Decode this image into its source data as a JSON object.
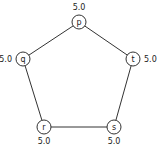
{
  "graph": {
    "nodes": [
      {
        "id": "p",
        "label": "p",
        "value": "5.0",
        "x": 79,
        "y": 22,
        "vx": 79,
        "vy": 10,
        "anchor": "middle"
      },
      {
        "id": "q",
        "label": "q",
        "value": "5.0",
        "x": 23,
        "y": 59,
        "vx": 12,
        "vy": 62,
        "anchor": "end"
      },
      {
        "id": "t",
        "label": "t",
        "value": "5.0",
        "x": 133,
        "y": 59,
        "vx": 144,
        "vy": 62,
        "anchor": "start"
      },
      {
        "id": "r",
        "label": "r",
        "value": "5.0",
        "x": 44,
        "y": 127,
        "vx": 44,
        "vy": 144,
        "anchor": "middle"
      },
      {
        "id": "s",
        "label": "s",
        "value": "5.0",
        "x": 114,
        "y": 127,
        "vx": 114,
        "vy": 144,
        "anchor": "middle"
      }
    ],
    "edges": [
      [
        "p",
        "q"
      ],
      [
        "p",
        "t"
      ],
      [
        "q",
        "r"
      ],
      [
        "r",
        "s"
      ],
      [
        "s",
        "t"
      ]
    ]
  }
}
